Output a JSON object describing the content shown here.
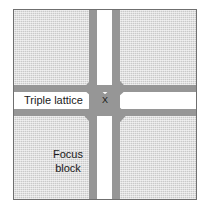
{
  "figure": {
    "labels": {
      "triple_lattice": "Triple lattice",
      "focus_block_line1": "Focus",
      "focus_block_line2": "block",
      "crossing": "X"
    },
    "caption": "",
    "colors": {
      "field": "#c9c9c9",
      "band": "#969696",
      "channel": "#ffffff",
      "border": "#6f6f6f",
      "text": "#1a1a1a"
    }
  }
}
